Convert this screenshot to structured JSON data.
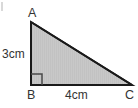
{
  "figure": {
    "kind": "right-triangle-diagram",
    "canvas": {
      "width": 138,
      "height": 108,
      "background": "#ffffff"
    },
    "colors": {
      "fill": "#c8c8c8",
      "stroke": "#1a1a1a",
      "text": "#333333",
      "stripe": "#c0c0c0"
    },
    "vertices": {
      "a": {
        "label": "A",
        "x": 31,
        "y": 22
      },
      "b": {
        "label": "B",
        "x": 31,
        "y": 85
      },
      "c": {
        "label": "C",
        "x": 132,
        "y": 85
      }
    },
    "sides": {
      "ab": {
        "label": "3cm",
        "value": 3,
        "unit": "cm"
      },
      "bc": {
        "label": "4cm",
        "value": 4,
        "unit": "cm"
      }
    },
    "right_angle": {
      "at_vertex": "B",
      "marker_size": 10
    }
  }
}
